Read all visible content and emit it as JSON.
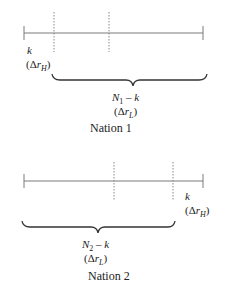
{
  "nation1": {
    "caption": "Nation 1",
    "left_label": {
      "var": "k",
      "delta": "(Δ",
      "r": "r",
      "sub": "H",
      "close": ")"
    },
    "brace_label": {
      "N": "N",
      "N_sub": "1",
      "minus_k": " – k",
      "delta": "(Δ",
      "r": "r",
      "sub": "L",
      "close": ")"
    }
  },
  "nation2": {
    "caption": "Nation 2",
    "right_label": {
      "var": "k",
      "delta": "(Δ",
      "r": "r",
      "sub": "H",
      "close": ")"
    },
    "brace_label": {
      "N": "N",
      "N_sub": "2",
      "minus_k": " – k",
      "delta": "(Δ",
      "r": "r",
      "sub": "L",
      "close": ")"
    }
  },
  "colors": {
    "line": "#777777",
    "text": "#222222",
    "brace": "#333333"
  }
}
